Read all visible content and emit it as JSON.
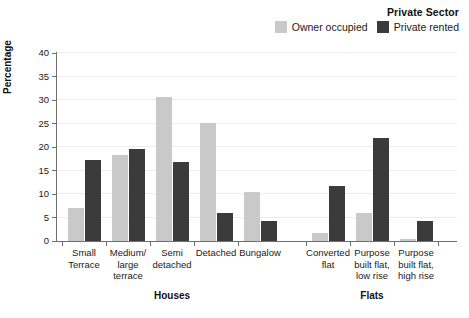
{
  "chart_data": {
    "type": "bar",
    "title": "",
    "xlabel": "",
    "ylabel": "Percentage",
    "ylim": [
      0,
      40
    ],
    "yticks": [
      0,
      5,
      10,
      15,
      20,
      25,
      30,
      35,
      40
    ],
    "grid": true,
    "legend_position": "top-right",
    "legend_title": "Private Sector",
    "categories": [
      "Small Terrace",
      "Medium/ large terrace",
      "Semi detached",
      "Detached",
      "Bungalow",
      "Converted flat",
      "Purpose built flat, low rise",
      "Purpose built flat, high rise"
    ],
    "series": [
      {
        "name": "Owner occupied",
        "color": "#c9c9c9",
        "values": [
          7.0,
          18.2,
          30.6,
          25.2,
          10.5,
          1.6,
          6.0,
          0.5
        ]
      },
      {
        "name": "Private rented",
        "color": "#3b3b3b",
        "values": [
          17.2,
          19.6,
          16.8,
          6.0,
          4.3,
          11.8,
          22.0,
          4.2
        ]
      }
    ],
    "groups": [
      {
        "label": "Houses",
        "categories": [
          0,
          1,
          2,
          3,
          4
        ]
      },
      {
        "label": "Flats",
        "categories": [
          5,
          6,
          7
        ]
      }
    ]
  },
  "legend": {
    "title": "Private Sector",
    "entries": [
      {
        "label": "Owner occupied",
        "color": "#c9c9c9"
      },
      {
        "label": "Private rented",
        "color": "#3b3b3b"
      }
    ]
  },
  "axes": {
    "y_title": "Percentage",
    "y_tick_labels": [
      "40",
      "35",
      "30",
      "25",
      "20",
      "15",
      "10",
      "5",
      "0"
    ],
    "x_category_labels": [
      [
        "Small",
        "Terrace"
      ],
      [
        "Medium/",
        "large",
        "terrace"
      ],
      [
        "Semi",
        "detached"
      ],
      [
        "Detached"
      ],
      [
        "Bungalow"
      ],
      [
        "Converted",
        "flat"
      ],
      [
        "Purpose",
        "built flat,",
        "low rise"
      ],
      [
        "Purpose",
        "built flat,",
        "high rise"
      ]
    ],
    "section_labels": [
      "Houses",
      "Flats"
    ]
  },
  "colors": {
    "owner_occupied": "#c9c9c9",
    "private_rented": "#3b3b3b",
    "axis": "#6f6f6f",
    "gridline": "#ececec",
    "background": "#ffffff"
  }
}
